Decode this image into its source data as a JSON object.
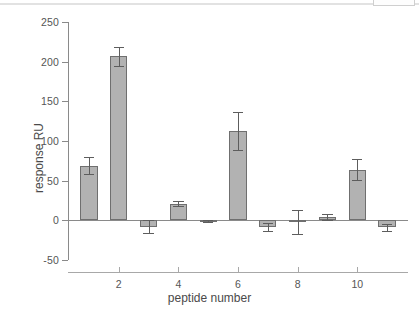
{
  "chart_data": {
    "type": "bar",
    "title": "",
    "xlabel": "peptide number",
    "ylabel": "response RU",
    "categories": [
      1,
      2,
      3,
      4,
      5,
      6,
      7,
      8,
      9,
      10,
      11
    ],
    "values": [
      69,
      207,
      -8,
      21,
      -1,
      113,
      -8,
      -2,
      4,
      64,
      -9
    ],
    "errors": [
      11,
      12,
      8,
      3,
      1,
      24,
      5,
      15,
      4,
      13,
      5
    ],
    "ylim": [
      -50,
      250
    ],
    "yticks": [
      250,
      200,
      150,
      100,
      50,
      0,
      -50
    ],
    "ytick_labels": [
      "250",
      "200",
      "150",
      "100",
      "50",
      "0",
      "-50"
    ],
    "xticks": [
      2,
      4,
      6,
      8,
      10
    ],
    "xtick_labels": [
      "2",
      "4",
      "6",
      "8",
      "10"
    ],
    "xlim": [
      0.3,
      11.7
    ],
    "grid": false,
    "legend": null,
    "bar_color": "#b2b2b2",
    "bar_edge_color": "#6f6f6f",
    "error_color": "#5d5d5d",
    "axis_color": "#8a8a8a",
    "background": "#ffffff"
  }
}
